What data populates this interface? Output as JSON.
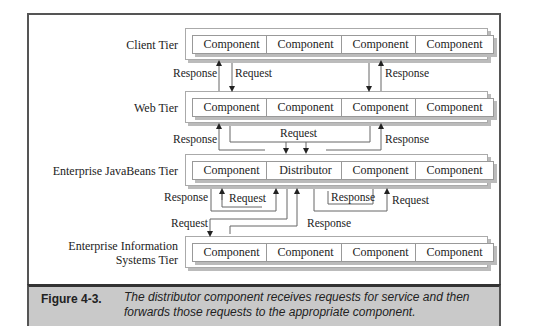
{
  "tiers": [
    {
      "label": "Client Tier",
      "components": [
        "Component",
        "Component",
        "Component",
        "Component"
      ]
    },
    {
      "label": "Web Tier",
      "components": [
        "Component",
        "Component",
        "Component",
        "Component"
      ]
    },
    {
      "label": "Enterprise JavaBeans Tier",
      "components": [
        "Component",
        "Distributor",
        "Component",
        "Component"
      ]
    },
    {
      "label_line1": "Enterprise Information",
      "label_line2": "Systems Tier",
      "components": [
        "Component",
        "Component",
        "Component",
        "Component"
      ]
    }
  ],
  "arrow_labels": {
    "client_web_left_response": "Response",
    "client_web_left_request": "Request",
    "client_web_right_response": "Response",
    "web_ejb_left_response": "Response",
    "web_ejb_request": "Request",
    "web_ejb_right_response": "Response",
    "ejb_internal_left_response": "Response",
    "ejb_internal_left_request": "Request",
    "ejb_internal_right_response": "Response",
    "ejb_internal_right_request": "Request",
    "ejb_eis_request": "Request",
    "ejb_eis_response": "Response"
  },
  "caption": {
    "label": "Figure 4-3.",
    "text": "The distributor component receives requests for service and then forwards those requests to the appropriate component."
  }
}
